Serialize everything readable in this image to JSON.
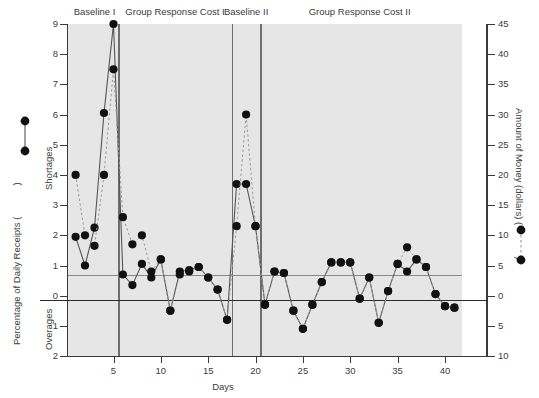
{
  "axes": {
    "left_title": "Percentage of Daily Receipts (",
    "left_title_close": ")",
    "left_upper_region": "Shortages",
    "left_lower_region": "Overages",
    "right_title": "Amount of Money (dollars) (",
    "right_title_close": ")",
    "x_title": "Days",
    "left_ticks": [
      "9",
      "8",
      "7",
      "6",
      "5",
      "4",
      "3",
      "2",
      "1",
      "0",
      "1",
      "2"
    ],
    "right_ticks": [
      "45",
      "40",
      "35",
      "30",
      "25",
      "20",
      "15",
      "10",
      "5",
      "0",
      "5",
      "10"
    ],
    "x_ticks": [
      "5",
      "10",
      "15",
      "20",
      "25",
      "30",
      "35",
      "40"
    ]
  },
  "phases": [
    {
      "label": "Baseline I",
      "start_day": 1,
      "end_day": 5
    },
    {
      "label": "Group Response Cost I",
      "start_day": 6,
      "end_day": 17
    },
    {
      "label": "Baseline II",
      "start_day": 18,
      "end_day": 20
    },
    {
      "label": "Group Response Cost II",
      "start_day": 21,
      "end_day": 41
    }
  ],
  "colors": {
    "plot_background": "#e6e6e6",
    "marker": "#111111",
    "solid_line": "#555555",
    "dashed_line": "#999999",
    "axis": "#3a3a3a",
    "phase_divider": "#6e6e6e",
    "zero_line": "#2a2a2a",
    "one_line": "#888888"
  },
  "chart_data": {
    "type": "line",
    "title": "",
    "xlabel": "Days",
    "ylabel": "Percentage of Daily Receipts",
    "y2label": "Amount of Money (dollars)",
    "xlim": [
      0.2,
      41.8
    ],
    "ylim": [
      -2,
      9
    ],
    "y2lim": [
      -10,
      45
    ],
    "grid": false,
    "reference_lines": [
      {
        "y": 0,
        "style": "solid-thick",
        "label": "zero"
      },
      {
        "y": 1,
        "style": "solid-thin",
        "label": "criterion"
      }
    ],
    "phase_dividers_x": [
      5.5,
      17.5,
      20.5
    ],
    "legend": [
      {
        "name": "Percentage of Daily Receipts",
        "style": "solid",
        "marker": "filled-circle",
        "axis": "left"
      },
      {
        "name": "Amount of Money (dollars)",
        "style": "dashed",
        "marker": "filled-circle",
        "axis": "right"
      }
    ],
    "x": [
      1,
      2,
      3,
      4,
      5,
      6,
      7,
      8,
      9,
      10,
      11,
      12,
      13,
      14,
      15,
      16,
      17,
      18,
      19,
      20,
      21,
      22,
      23,
      24,
      25,
      26,
      27,
      28,
      29,
      30,
      31,
      32,
      33,
      34,
      35,
      36,
      37,
      38,
      39,
      40,
      41
    ],
    "series": [
      {
        "name": "Percentage of Daily Receipts",
        "style": "solid",
        "axis": "left",
        "values": [
          1.95,
          1.0,
          2.25,
          6.05,
          9.0,
          0.7,
          0.35,
          1.05,
          0.6,
          1.2,
          -0.5,
          0.8,
          0.85,
          0.95,
          0.6,
          0.2,
          -0.8,
          3.7,
          3.7,
          2.3,
          -0.3,
          0.8,
          0.75,
          -0.5,
          -1.1,
          -0.3,
          0.45,
          1.1,
          1.1,
          1.1,
          -0.1,
          0.6,
          -0.9,
          0.15,
          1.05,
          0.8,
          1.2,
          0.95,
          0.05,
          -0.35,
          -0.4
        ]
      },
      {
        "name": "Amount of Money (dollars)",
        "style": "dashed",
        "axis": "right",
        "values": [
          20.0,
          10.0,
          8.25,
          20.0,
          37.5,
          13.0,
          8.5,
          10.0,
          4.0,
          6.0,
          -2.5,
          3.5,
          4.0,
          4.75,
          3.0,
          1.0,
          -4.0,
          11.5,
          30.0,
          11.5,
          -1.5,
          4.0,
          3.75,
          -2.5,
          -5.5,
          -1.5,
          2.25,
          5.5,
          5.5,
          5.5,
          -0.5,
          3.0,
          -4.5,
          0.75,
          5.25,
          8.0,
          6.0,
          4.75,
          0.25,
          -1.75,
          -2.0
        ]
      }
    ]
  }
}
